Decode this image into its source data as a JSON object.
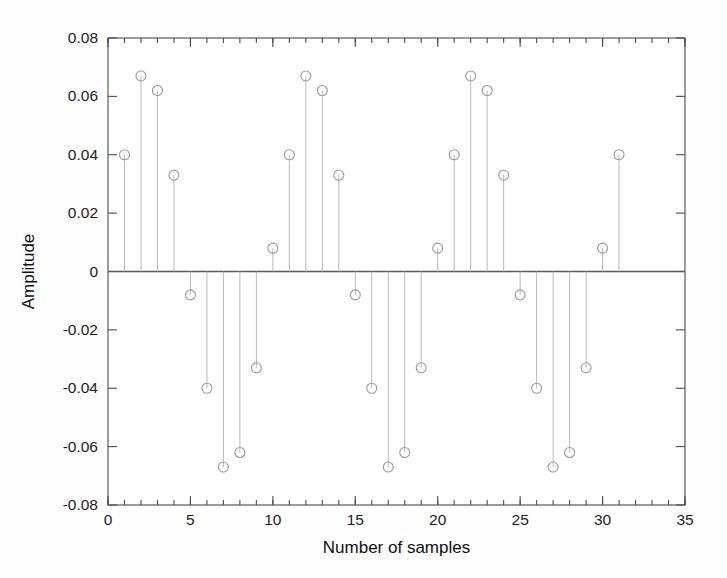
{
  "chart_data": {
    "type": "scatter",
    "plot_style": "stem",
    "title": "",
    "xlabel": "Number of samples",
    "ylabel": "Amplitude",
    "x": [
      1,
      2,
      3,
      4,
      5,
      6,
      7,
      8,
      9,
      10,
      11,
      12,
      13,
      14,
      15,
      16,
      17,
      18,
      19,
      20,
      21,
      22,
      23,
      24,
      25,
      26,
      27,
      28,
      29,
      30,
      31
    ],
    "values": [
      0.04,
      0.067,
      0.062,
      0.033,
      -0.008,
      -0.04,
      -0.067,
      -0.062,
      -0.033,
      0.008,
      0.04,
      0.067,
      0.062,
      0.033,
      -0.008,
      -0.04,
      -0.067,
      -0.062,
      -0.033,
      0.008,
      0.04,
      0.067,
      0.062,
      0.033,
      -0.008,
      -0.04,
      -0.067,
      -0.062,
      -0.033,
      0.008,
      0.04
    ],
    "xlim": [
      0,
      35
    ],
    "ylim": [
      -0.08,
      0.08
    ],
    "xticks": [
      0,
      5,
      10,
      15,
      20,
      25,
      30,
      35
    ],
    "xtick_labels": [
      "0",
      "5",
      "10",
      "15",
      "20",
      "25",
      "30",
      "35"
    ],
    "yticks": [
      -0.08,
      -0.06,
      -0.04,
      -0.02,
      0,
      0.02,
      0.04,
      0.06,
      0.08
    ],
    "ytick_labels": [
      "-0.08",
      "-0.06",
      "-0.04",
      "-0.02",
      "0",
      "0.02",
      "0.04",
      "0.06",
      "0.08"
    ],
    "x_minor_tick_step": 1,
    "grid": false,
    "legend": null,
    "period": 10,
    "colors": {
      "axis": "#4a4a4a",
      "stem": "#b9b9b9",
      "marker": "#9a9a9a",
      "background": "#fefefe",
      "text": "#1d1d1d"
    },
    "marker": "circle-open",
    "marker_radius": 5
  }
}
